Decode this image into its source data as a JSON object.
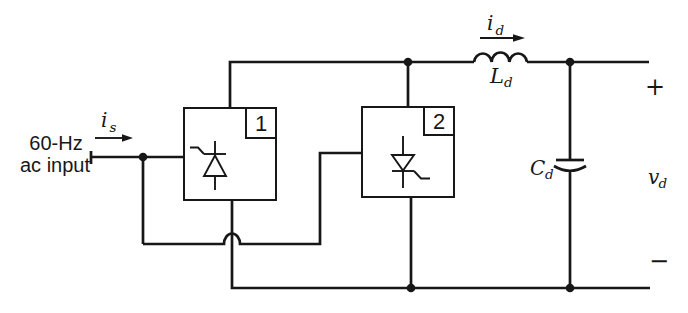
{
  "colors": {
    "ink": "#171717",
    "background": "#ffffff"
  },
  "icons": {
    "converter_1_device": "thyristor-icon",
    "converter_2_device": "thyristor-icon",
    "inductor": "inductor-coil-icon",
    "capacitor": "capacitor-plates-icon",
    "junctions": "connection-dot"
  },
  "labels": {
    "source_line1": "60-Hz",
    "source_line2": "ac input",
    "source_current": {
      "base": "i",
      "sub": "s"
    },
    "dc_current": {
      "base": "i",
      "sub": "d"
    },
    "inductor": {
      "base": "L",
      "sub": "d"
    },
    "capacitor": {
      "base": "C",
      "sub": "d"
    },
    "output_voltage": {
      "base": "v",
      "sub": "d"
    },
    "converter_1": "1",
    "converter_2": "2",
    "polarity_plus": "+",
    "polarity_minus": "−"
  }
}
